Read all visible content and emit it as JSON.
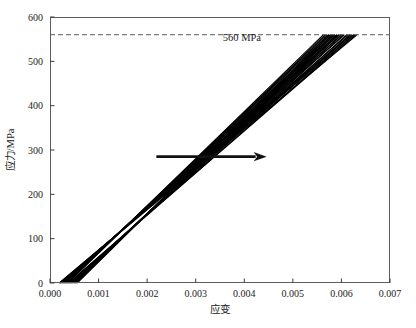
{
  "chart_data": {
    "type": "line",
    "title": "",
    "xlabel": "应变",
    "ylabel": "应力/MPa",
    "xlim": [
      0.0,
      0.007
    ],
    "ylim": [
      0,
      600
    ],
    "xticks": [
      0.0,
      0.001,
      0.002,
      0.003,
      0.004,
      0.005,
      0.006,
      0.007
    ],
    "xtick_labels": [
      "0.000",
      "0.001",
      "0.002",
      "0.003",
      "0.004",
      "0.005",
      "0.006",
      "0.007"
    ],
    "yticks": [
      0,
      100,
      200,
      300,
      400,
      500,
      600
    ],
    "ytick_labels": [
      "0",
      "100",
      "200",
      "300",
      "400",
      "500",
      "600"
    ],
    "grid": false,
    "legend": null,
    "annotations": [
      {
        "name": "threshold-label",
        "text": "560 MPa",
        "x": 0.00395,
        "y": 545
      }
    ],
    "threshold": {
      "name": "560-mpa-dashed-line",
      "value": 560,
      "label": "560 MPa",
      "style": "dashed",
      "color": "#5a5a5a"
    },
    "arrow": {
      "name": "trend-arrow",
      "direction": "right",
      "x_start": 0.00219,
      "x_end": 0.00446,
      "y": 285,
      "color": "#111111"
    },
    "series": [
      {
        "name": "specimen-01",
        "color": "#000000",
        "width": 1.1,
        "x": [
          0.00019,
          0.00632
        ],
        "y": [
          0,
          560
        ]
      },
      {
        "name": "specimen-02",
        "color": "#000000",
        "width": 1.1,
        "x": [
          0.000215,
          0.00618
        ],
        "y": [
          0,
          560
        ]
      },
      {
        "name": "specimen-03",
        "color": "#000000",
        "width": 1.1,
        "x": [
          0.00024,
          0.00606
        ],
        "y": [
          0,
          560
        ]
      },
      {
        "name": "specimen-04",
        "color": "#000000",
        "width": 1.1,
        "x": [
          0.000265,
          0.00595
        ],
        "y": [
          0,
          560
        ]
      },
      {
        "name": "specimen-05",
        "color": "#000000",
        "width": 1.1,
        "x": [
          0.00029,
          0.00586
        ],
        "y": [
          0,
          560
        ]
      },
      {
        "name": "specimen-06",
        "color": "#000000",
        "width": 1.1,
        "x": [
          0.000315,
          0.00578
        ],
        "y": [
          0,
          560
        ]
      },
      {
        "name": "specimen-07",
        "color": "#000000",
        "width": 1.1,
        "x": [
          0.00034,
          0.0057
        ],
        "y": [
          0,
          560
        ]
      },
      {
        "name": "specimen-08",
        "color": "#000000",
        "width": 1.1,
        "x": [
          0.000365,
          0.00563
        ],
        "y": [
          0,
          560
        ]
      },
      {
        "name": "specimen-09",
        "color": "#000000",
        "width": 1.1,
        "x": [
          0.000395,
          0.006255
        ],
        "y": [
          0,
          560
        ]
      },
      {
        "name": "specimen-10",
        "color": "#000000",
        "width": 1.1,
        "x": [
          0.000425,
          0.00611
        ],
        "y": [
          0,
          560
        ]
      },
      {
        "name": "specimen-11",
        "color": "#000000",
        "width": 1.1,
        "x": [
          0.000455,
          0.005995
        ],
        "y": [
          0,
          560
        ]
      },
      {
        "name": "specimen-12",
        "color": "#000000",
        "width": 1.1,
        "x": [
          0.00049,
          0.0059
        ],
        "y": [
          0,
          560
        ]
      },
      {
        "name": "specimen-13",
        "color": "#000000",
        "width": 1.1,
        "x": [
          0.000525,
          0.00582
        ],
        "y": [
          0,
          560
        ]
      },
      {
        "name": "specimen-14",
        "color": "#000000",
        "width": 1.1,
        "x": [
          0.00056,
          0.005745
        ],
        "y": [
          0,
          560
        ]
      },
      {
        "name": "specimen-15",
        "color": "#000000",
        "width": 1.1,
        "x": [
          0.000205,
          0.00625
        ],
        "y": [
          0,
          560
        ]
      },
      {
        "name": "specimen-16",
        "color": "#000000",
        "width": 1.1,
        "x": [
          0.000255,
          0.006005
        ],
        "y": [
          0,
          560
        ]
      },
      {
        "name": "specimen-17",
        "color": "#000000",
        "width": 1.1,
        "x": [
          0.000305,
          0.00582
        ],
        "y": [
          0,
          560
        ]
      },
      {
        "name": "specimen-18",
        "color": "#000000",
        "width": 1.1,
        "x": [
          0.000355,
          0.005665
        ],
        "y": [
          0,
          560
        ]
      },
      {
        "name": "specimen-19",
        "color": "#000000",
        "width": 1.1,
        "x": [
          0.00041,
          0.00618
        ],
        "y": [
          0,
          560
        ]
      },
      {
        "name": "specimen-20",
        "color": "#000000",
        "width": 1.1,
        "x": [
          0.00047,
          0.005945
        ],
        "y": [
          0,
          560
        ]
      },
      {
        "name": "specimen-21",
        "color": "#000000",
        "width": 1.1,
        "x": [
          0.00054,
          0.005775
        ],
        "y": [
          0,
          560
        ]
      },
      {
        "name": "specimen-22",
        "color": "#000000",
        "width": 1.1,
        "x": [
          0.00023,
          0.006135
        ],
        "y": [
          0,
          560
        ]
      },
      {
        "name": "specimen-23",
        "color": "#000000",
        "width": 1.1,
        "x": [
          0.00028,
          0.005915
        ],
        "y": [
          0,
          560
        ]
      },
      {
        "name": "specimen-24",
        "color": "#000000",
        "width": 1.1,
        "x": [
          0.00033,
          0.005735
        ],
        "y": [
          0,
          560
        ]
      },
      {
        "name": "specimen-25",
        "color": "#000000",
        "width": 1.1,
        "x": [
          0.00038,
          0.00629
        ],
        "y": [
          0,
          560
        ]
      },
      {
        "name": "specimen-26",
        "color": "#000000",
        "width": 1.1,
        "x": [
          0.00044,
          0.006045
        ],
        "y": [
          0,
          560
        ]
      },
      {
        "name": "specimen-27",
        "color": "#000000",
        "width": 1.1,
        "x": [
          0.000505,
          0.00586
        ],
        "y": [
          0,
          560
        ]
      },
      {
        "name": "specimen-28",
        "color": "#000000",
        "width": 1.1,
        "x": [
          0.0002,
          0.006215
        ],
        "y": [
          0,
          560
        ]
      }
    ]
  },
  "plot_geometry": {
    "left": 50,
    "right": 390,
    "top": 17,
    "bottom": 283
  }
}
